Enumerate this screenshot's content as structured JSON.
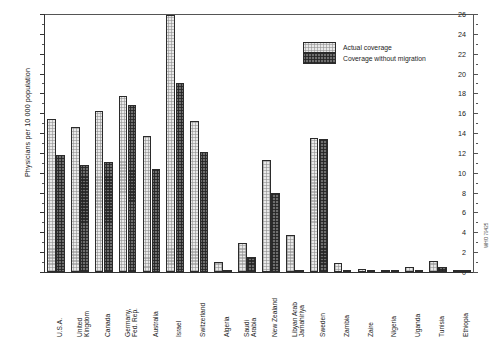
{
  "chart_data": {
    "type": "bar",
    "title": "",
    "xlabel": "",
    "ylabel": "Physicians per 10 000 population",
    "ylim": [
      0,
      26
    ],
    "ytick_step": 2,
    "yticks": [
      0,
      2,
      4,
      6,
      8,
      10,
      12,
      14,
      16,
      18,
      20,
      22,
      24,
      26
    ],
    "grid": false,
    "legend_position": "top-right",
    "categories": [
      "U.S.A.",
      "United\nKingdom",
      "Canada",
      "Germany,\nFed. Rep.",
      "Australia",
      "Israel",
      "Switzerland",
      "Algeria",
      "Saudi\nArabia",
      "New Zealand",
      "Libyan Arab\nJamahiriya",
      "Sweden",
      "Zambia",
      "Zaire",
      "Nigeria",
      "Uganda",
      "Tunisia",
      "Ethiopia"
    ],
    "series": [
      {
        "name": "Actual coverage",
        "fill": "light-stipple",
        "values": [
          15.4,
          14.6,
          16.2,
          17.7,
          13.7,
          25.9,
          15.2,
          1.0,
          2.9,
          11.3,
          3.7,
          13.5,
          0.9,
          0.35,
          0.2,
          0.5,
          1.1,
          0.12
        ]
      },
      {
        "name": "Coverage without migration",
        "fill": "dark-stipple",
        "values": [
          11.8,
          10.8,
          11.1,
          16.8,
          10.4,
          19.0,
          12.1,
          0.15,
          1.5,
          8.0,
          0.15,
          13.4,
          0.0,
          0.15,
          0.1,
          0.15,
          0.55,
          0.03
        ]
      }
    ]
  },
  "legend": {
    "items": [
      {
        "label": "Actual coverage"
      },
      {
        "label": "Coverage without migration"
      }
    ]
  },
  "footer": {
    "figure_code": "WHO 79425"
  }
}
